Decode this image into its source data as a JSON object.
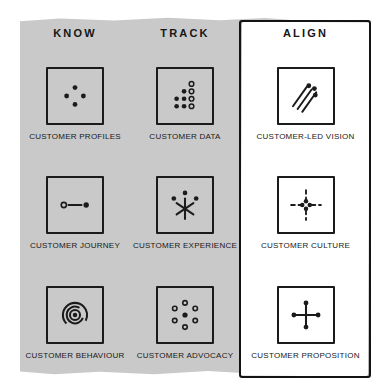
{
  "diagram": {
    "title_row": [
      "KNOW",
      "TRACK",
      "ALIGN"
    ],
    "colors": {
      "panel_grey": "#c9c9c9",
      "ink": "#1b1b1b",
      "highlight_border": "#141414",
      "highlight_fill": "#ffffff"
    },
    "columns": [
      {
        "header": "KNOW",
        "highlighted": false,
        "cells": [
          {
            "label": "CUSTOMER PROFILES",
            "icon": "four-dots-diamond-icon"
          },
          {
            "label": "CUSTOMER JOURNEY",
            "icon": "hollow-dot-line-filled-dot-icon"
          },
          {
            "label": "CUSTOMER BEHAVIOUR",
            "icon": "concentric-target-rings-icon"
          }
        ]
      },
      {
        "header": "TRACK",
        "highlighted": false,
        "cells": [
          {
            "label": "CUSTOMER DATA",
            "icon": "dot-staircase-icon"
          },
          {
            "label": "CUSTOMER EXPERIENCE",
            "icon": "asterisk-burst-with-dots-icon"
          },
          {
            "label": "CUSTOMER ADVOCACY",
            "icon": "ring-of-hollow-dots-icon"
          }
        ]
      },
      {
        "header": "ALIGN",
        "highlighted": true,
        "cells": [
          {
            "label": "CUSTOMER-LED VISION",
            "icon": "diagonal-motion-trails-icon"
          },
          {
            "label": "CUSTOMER CULTURE",
            "icon": "dashed-cross-dot-cluster-icon"
          },
          {
            "label": "CUSTOMER PROPOSITION",
            "icon": "cross-with-end-dots-icon"
          }
        ]
      }
    ]
  }
}
